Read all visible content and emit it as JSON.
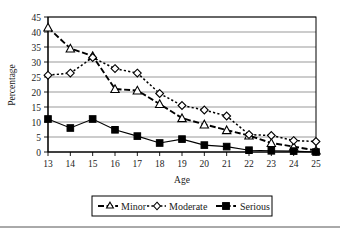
{
  "chart_data": {
    "type": "line",
    "title": "",
    "xlabel": "Age",
    "ylabel": "Percentage",
    "categories": [
      13,
      14,
      15,
      16,
      17,
      18,
      19,
      20,
      21,
      22,
      23,
      24,
      25
    ],
    "xtick_labels": [
      "13",
      "14",
      "15",
      "16",
      "17",
      "18",
      "19",
      "20",
      "21",
      "22",
      "23",
      "24",
      "25"
    ],
    "ytick_labels": [
      "0",
      "5",
      "10",
      "15",
      "20",
      "25",
      "30",
      "35",
      "40",
      "45"
    ],
    "ylim": [
      0,
      45
    ],
    "ytick_step": 5,
    "xlim": [
      13,
      25
    ],
    "grid": "horizontal",
    "legend_position": "bottom-center",
    "series": [
      {
        "name": "Minor",
        "marker": "open-triangle",
        "linestyle": "dashed",
        "color": "#000000",
        "values": [
          41.5,
          34.5,
          32.0,
          21.0,
          20.5,
          16.0,
          11.3,
          9.2,
          7.3,
          5.5,
          3.0,
          1.8,
          0.5
        ]
      },
      {
        "name": "Moderate",
        "marker": "open-diamond",
        "linestyle": "dotted",
        "color": "#000000",
        "values": [
          25.6,
          26.3,
          31.5,
          27.8,
          26.3,
          19.5,
          15.5,
          14.0,
          12.0,
          5.8,
          5.5,
          3.8,
          3.5
        ]
      },
      {
        "name": "Serious",
        "marker": "filled-square",
        "linestyle": "solid",
        "color": "#000000",
        "values": [
          11.0,
          8.0,
          11.0,
          7.4,
          5.3,
          3.0,
          4.3,
          2.3,
          1.8,
          0.6,
          0.4,
          0.3,
          0.0
        ]
      }
    ]
  },
  "legend": {
    "entries": [
      {
        "label": "Minor"
      },
      {
        "label": "Moderate"
      },
      {
        "label": "Serious"
      }
    ]
  }
}
